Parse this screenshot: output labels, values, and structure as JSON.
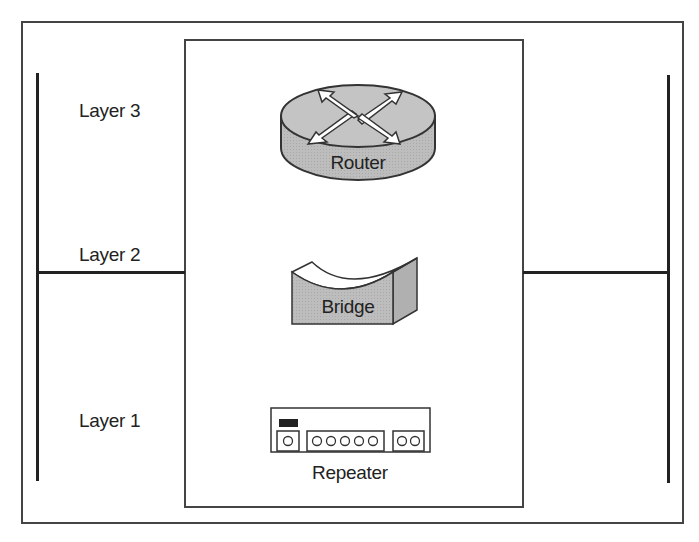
{
  "diagram": {
    "title": "",
    "layers": [
      {
        "label": "Layer 3",
        "device": "Router"
      },
      {
        "label": "Layer 2",
        "device": "Bridge"
      },
      {
        "label": "Layer 1",
        "device": "Repeater"
      }
    ],
    "devices": {
      "router": {
        "label": "Router",
        "icon": "router-icon"
      },
      "bridge": {
        "label": "Bridge",
        "icon": "bridge-icon"
      },
      "repeater": {
        "label": "Repeater",
        "icon": "repeater-icon",
        "port_groups": [
          1,
          5,
          2
        ]
      }
    },
    "colors": {
      "device_fill": "#b8b8b8",
      "device_top": "#c8c8c8",
      "line": "#222222",
      "border": "#444444"
    }
  }
}
